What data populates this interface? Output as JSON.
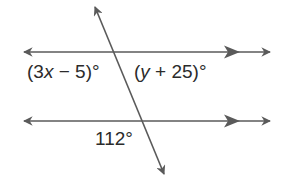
{
  "diagram": {
    "colors": {
      "line": "#5a5a5a",
      "text": "#2b2b2b",
      "background": "#ffffff"
    },
    "lines": [
      {
        "name": "top-parallel-line",
        "x1": 22,
        "y1": 52,
        "x2": 272,
        "y2": 52,
        "parallel_marks": 2
      },
      {
        "name": "bottom-parallel-line",
        "x1": 22,
        "y1": 121,
        "x2": 272,
        "y2": 121,
        "parallel_marks": 2
      },
      {
        "name": "transversal-line",
        "x1": 94,
        "y1": 5,
        "x2": 165,
        "y2": 176
      }
    ],
    "labels": {
      "angle_top_left": {
        "pre": "(3",
        "var": "x",
        "post": " − 5)°"
      },
      "angle_top_right": {
        "pre": "(",
        "var": "y",
        "post": " + 25)°"
      },
      "angle_bottom_left": {
        "text": "112°"
      }
    }
  }
}
